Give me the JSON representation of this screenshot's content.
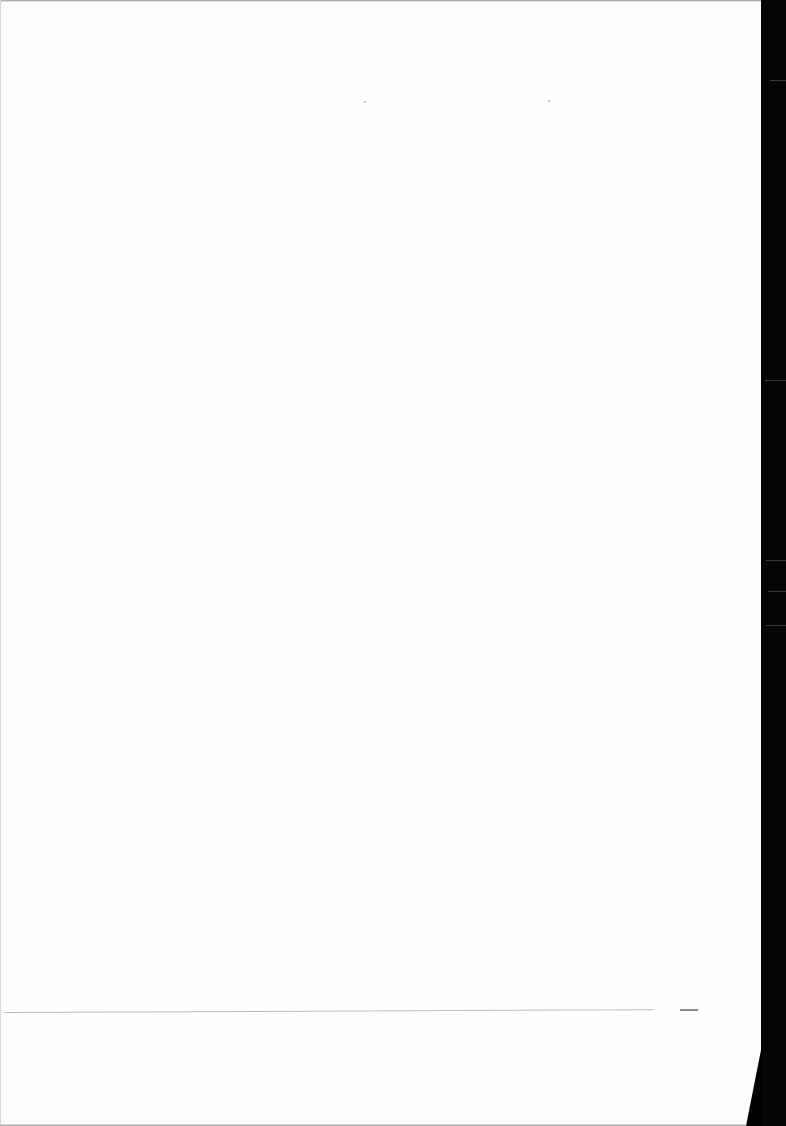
{
  "document": {
    "type": "scanned-page",
    "content": "",
    "page_background": "#fefefe",
    "scan_border_color": "#050505"
  }
}
